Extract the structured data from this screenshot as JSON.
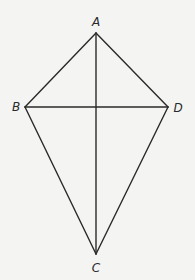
{
  "figure": {
    "type": "kite",
    "background": "#f4f4f2",
    "stroke_color": "#2a2a2a",
    "vertices": {
      "A": {
        "label": "A",
        "x": 96,
        "y": 33
      },
      "B": {
        "label": "B",
        "x": 25,
        "y": 107
      },
      "C": {
        "label": "C",
        "x": 96,
        "y": 254
      },
      "D": {
        "label": "D",
        "x": 168,
        "y": 107
      }
    },
    "sides": [
      "AB",
      "BC",
      "CD",
      "DA"
    ],
    "diagonals": [
      "AC",
      "BD"
    ]
  }
}
